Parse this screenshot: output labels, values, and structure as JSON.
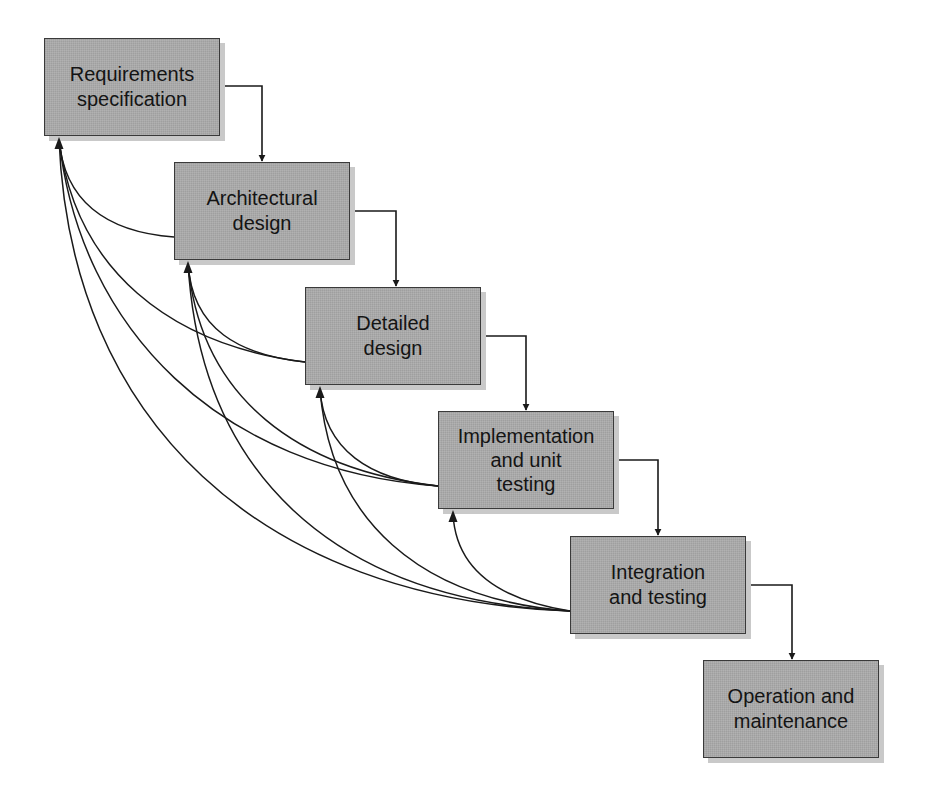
{
  "diagram": {
    "type": "waterfall-model",
    "stages": [
      {
        "id": "requirements",
        "label": "Requirements\nspecification"
      },
      {
        "id": "architectural",
        "label": "Architectural\ndesign"
      },
      {
        "id": "detailed",
        "label": "Detailed\ndesign"
      },
      {
        "id": "implementation",
        "label": "Implementation\nand unit\ntesting"
      },
      {
        "id": "integration",
        "label": "Integration\nand testing"
      },
      {
        "id": "operation",
        "label": "Operation and\nmaintenance"
      }
    ],
    "forward_flow": [
      {
        "from": "requirements",
        "to": "architectural"
      },
      {
        "from": "architectural",
        "to": "detailed"
      },
      {
        "from": "detailed",
        "to": "implementation"
      },
      {
        "from": "implementation",
        "to": "integration"
      },
      {
        "from": "integration",
        "to": "operation"
      }
    ],
    "feedback_flow": [
      {
        "from": "architectural",
        "to": "requirements"
      },
      {
        "from": "detailed",
        "to": "requirements"
      },
      {
        "from": "detailed",
        "to": "architectural"
      },
      {
        "from": "implementation",
        "to": "requirements"
      },
      {
        "from": "implementation",
        "to": "architectural"
      },
      {
        "from": "implementation",
        "to": "detailed"
      },
      {
        "from": "integration",
        "to": "requirements"
      },
      {
        "from": "integration",
        "to": "architectural"
      },
      {
        "from": "integration",
        "to": "detailed"
      },
      {
        "from": "integration",
        "to": "implementation"
      }
    ],
    "colors": {
      "box_fill": "#a9a9a9",
      "box_border": "#3a3a3a",
      "shadow": "#c9c9c9",
      "line": "#1a1a1a",
      "text": "#141414"
    }
  }
}
